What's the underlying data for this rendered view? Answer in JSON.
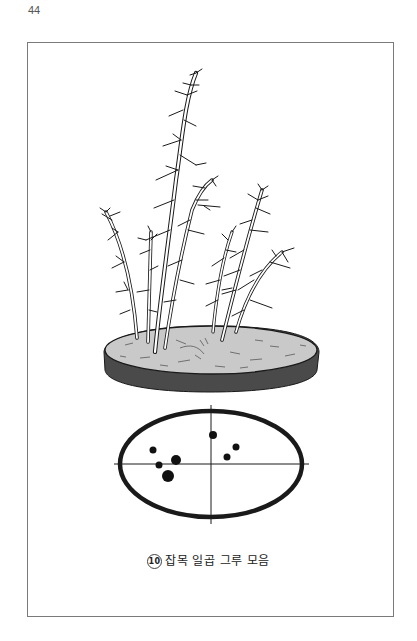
{
  "page": {
    "number": "44"
  },
  "figure": {
    "caption_number": "⑩",
    "caption_number_value": "10",
    "caption_text": "잡목 일곱 그루 모음",
    "illustration": "bonsai-forest-planting-seven-deciduous-trees-in-oval-pot",
    "diagram": {
      "type": "planting-plan-top-view",
      "shape": "oval-pot",
      "tree_count": 7,
      "tree_positions": [
        {
          "x": 153,
          "y": 450,
          "r": 3.5
        },
        {
          "x": 159,
          "y": 465,
          "r": 3.5
        },
        {
          "x": 176,
          "y": 460,
          "r": 5
        },
        {
          "x": 168,
          "y": 476,
          "r": 6
        },
        {
          "x": 213,
          "y": 435,
          "r": 4
        },
        {
          "x": 236,
          "y": 447,
          "r": 3.5
        },
        {
          "x": 227,
          "y": 457,
          "r": 3.5
        }
      ]
    }
  },
  "colors": {
    "ink": "#1a1a1a",
    "soil": "#c9c9c9",
    "pot_rim": "#4a4a4a",
    "frame": "#7a7a7a"
  }
}
